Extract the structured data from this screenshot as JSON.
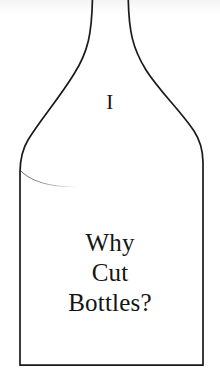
{
  "page": {
    "kind": "book-page-illustration",
    "background_color": "#ffffff",
    "ink_color": "#141414",
    "width": 220,
    "height": 390
  },
  "illustration": {
    "name": "bottle-outline",
    "description": "Line drawing of a wine bottle outline, neck running off the top edge of the page, sloping shoulders, straight vertical sides and a flat base.",
    "stroke_color": "#1a1a1a",
    "stroke_width": 1.6,
    "fill": "none",
    "details": {
      "neck_left_x": 92,
      "neck_right_x": 128,
      "body_left_x": 20,
      "body_right_x": 203,
      "base_y": 366,
      "shoulder_end_left_y": 172,
      "shoulder_end_right_y": 162
    },
    "fill_line": {
      "name": "faint-waterline-arc",
      "description": "A thin faint arc sweeping right from the left wall, fading out mid-body.",
      "stroke_color": "#6f6f6f",
      "stroke_width": 0.7
    }
  },
  "chapter": {
    "numeral": "I"
  },
  "title": {
    "lines": [
      "Why",
      "Cut",
      "Bottles?"
    ],
    "full_text": "Why Cut Bottles?"
  }
}
